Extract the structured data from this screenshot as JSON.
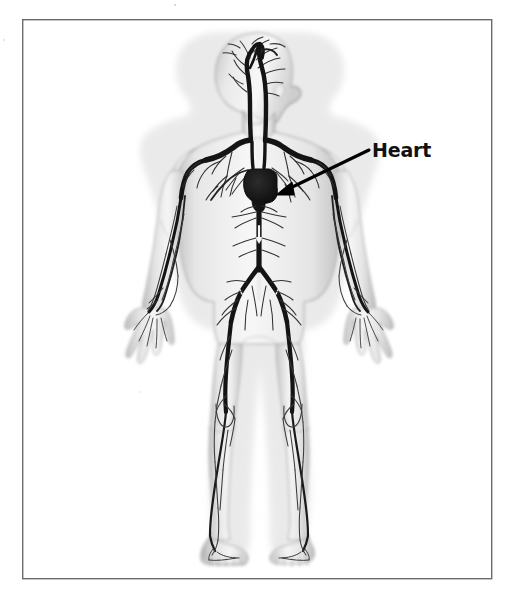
{
  "figure": {
    "kind": "anatomy-diagram",
    "view": "anterior-full-body-child",
    "background_color": "#ffffff",
    "border": {
      "present": true,
      "color": "#6b6b6b",
      "x": 22,
      "y": 19,
      "width": 470,
      "height": 560,
      "stroke_width": 1.4
    },
    "labels": [
      {
        "id": "heart",
        "text": "Heart",
        "text_color": "#111111",
        "x": 372,
        "y": 157,
        "font_size_px": 19,
        "bold": true,
        "leader": {
          "type": "arrow",
          "color": "#000000",
          "from_x": 369,
          "from_y": 150,
          "to_x": 278,
          "to_y": 194,
          "stroke_width": 3.2
        }
      }
    ],
    "body": {
      "skin_fill": "#ebebeb",
      "skin_shade": "#b9b9b9",
      "skin_highlight": "#f7f7f7",
      "outline_color": "#9a9a9a"
    },
    "vessels": {
      "major_color": "#141414",
      "minor_color": "#2b2b2b",
      "major_stroke_width": 5,
      "minor_stroke_width": 1.1
    },
    "organs": [
      {
        "id": "heart-organ",
        "name": "heart",
        "fill": "#1a1a1a",
        "center_x": 261,
        "center_y": 186,
        "width": 30,
        "height": 30
      }
    ],
    "scan_artifacts": [
      {
        "id": "speck-top",
        "x": 175,
        "y": 5,
        "r": 1.1,
        "color": "#cfcfcf"
      },
      {
        "id": "speck-left",
        "x": 4,
        "y": 40,
        "r": 0.9,
        "color": "#d8d8d8"
      },
      {
        "id": "speck-right",
        "x": 352,
        "y": 252,
        "r": 0.8,
        "color": "#d5d5d5"
      }
    ]
  }
}
